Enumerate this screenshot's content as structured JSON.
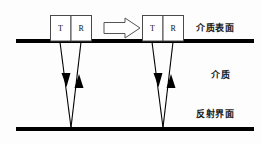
{
  "figure": {
    "background_color": "#fdfdfd",
    "line_color": "#000000",
    "width": 261,
    "height": 144
  },
  "interfaces": {
    "surface": {
      "label": "介质表面",
      "y": 41,
      "x_start": 16,
      "x_end": 254,
      "thickness": 4
    },
    "reflector": {
      "label": "反射界面",
      "y": 129,
      "x_start": 16,
      "x_end": 254,
      "thickness": 4
    }
  },
  "medium": {
    "label": "介质"
  },
  "probes": [
    {
      "id": "probe-left",
      "position": "left",
      "x": 50,
      "y": 15,
      "width": 42,
      "height": 26,
      "cells": [
        {
          "label": "T",
          "role": "transmitter"
        },
        {
          "label": "R",
          "role": "receiver"
        }
      ]
    },
    {
      "id": "probe-right",
      "position": "right",
      "x": 142,
      "y": 15,
      "width": 42,
      "height": 26,
      "cells": [
        {
          "label": "T",
          "role": "transmitter"
        },
        {
          "label": "R",
          "role": "receiver"
        }
      ]
    }
  ],
  "motion_arrow": {
    "name": "移动方向",
    "direction": "right",
    "x": 104,
    "y": 20,
    "width": 36,
    "height": 16
  },
  "ray_paths": [
    {
      "id": "ray-left",
      "emit_x": 60,
      "return_x": 81,
      "apex_x": 71,
      "top_y": 41,
      "bottom_y": 128,
      "down_arrow_y": 82,
      "up_arrow_y": 82
    },
    {
      "id": "ray-right",
      "emit_x": 152,
      "return_x": 173,
      "apex_x": 163,
      "top_y": 41,
      "bottom_y": 128,
      "down_arrow_y": 82,
      "up_arrow_y": 82
    }
  ]
}
